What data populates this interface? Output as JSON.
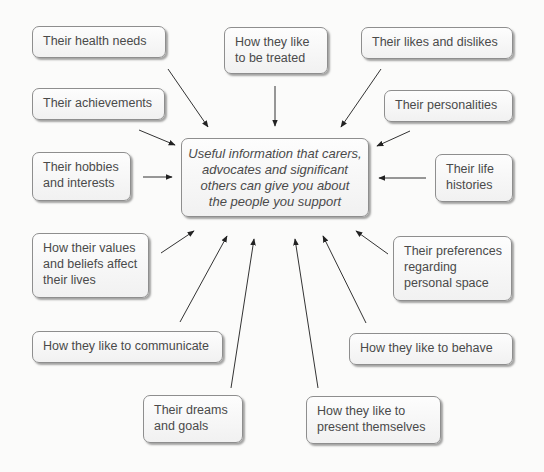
{
  "diagram": {
    "type": "spider-diagram",
    "center": {
      "text": "Useful information that carers,\nadvocates and significant\nothers can give you about\nthe people you support",
      "style": "italic"
    },
    "nodes": [
      {
        "id": "health",
        "text": "Their health needs"
      },
      {
        "id": "treated",
        "text": "How they like\nto be treated"
      },
      {
        "id": "likes",
        "text": "Their likes and dislikes"
      },
      {
        "id": "achievements",
        "text": "Their achievements"
      },
      {
        "id": "personalities",
        "text": "Their personalities"
      },
      {
        "id": "hobbies",
        "text": "Their hobbies\nand interests"
      },
      {
        "id": "life",
        "text": "Their life\nhistories"
      },
      {
        "id": "values",
        "text": "How their values\nand beliefs affect\ntheir lives"
      },
      {
        "id": "space",
        "text": "Their preferences\nregarding\npersonal space"
      },
      {
        "id": "communicate",
        "text": "How they like to communicate"
      },
      {
        "id": "behave",
        "text": "How they like to behave"
      },
      {
        "id": "dreams",
        "text": "Their dreams\nand goals"
      },
      {
        "id": "present",
        "text": "How they like to\npresent themselves"
      }
    ],
    "edges_direction": "all nodes point to center",
    "colors": {
      "background": "#fbfbfa",
      "box_border": "#8e8e8e",
      "text": "#4a4a4a",
      "arrow": "#222222"
    }
  }
}
